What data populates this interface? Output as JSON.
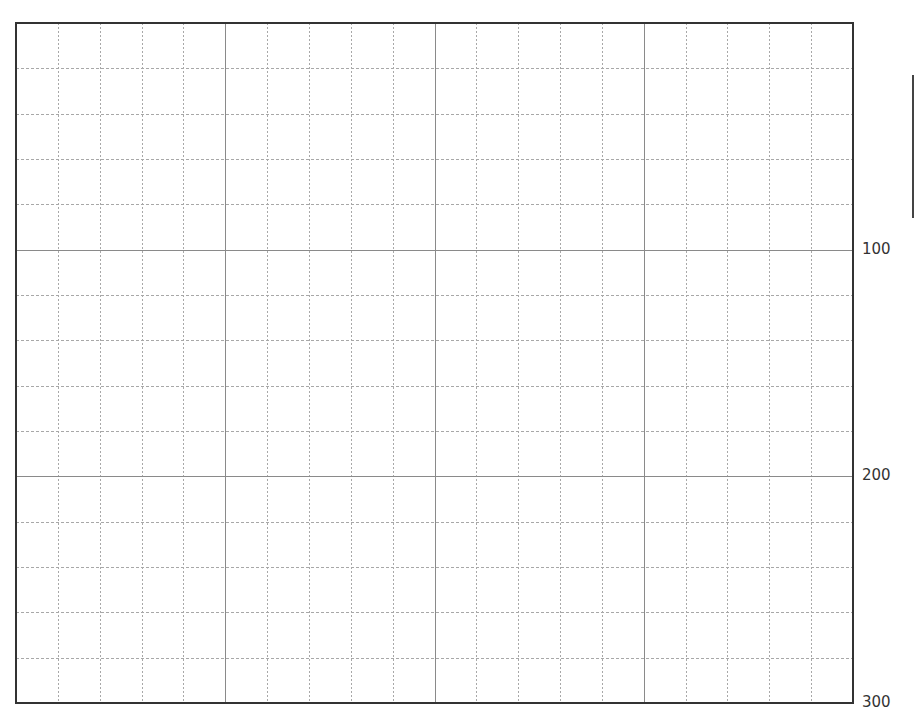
{
  "grid": {
    "frame": {
      "left": 16,
      "top": 23,
      "right": 853,
      "bottom": 703
    },
    "columns": 20,
    "rows": 15,
    "major_every": 5,
    "colors": {
      "frame": "#333333",
      "major": "#8a8a8a",
      "minor": "#a8a8a8"
    }
  },
  "axis_labels": [
    {
      "text": "100",
      "y": 250
    },
    {
      "text": "200",
      "y": 476
    },
    {
      "text": "300",
      "y": 703
    }
  ]
}
